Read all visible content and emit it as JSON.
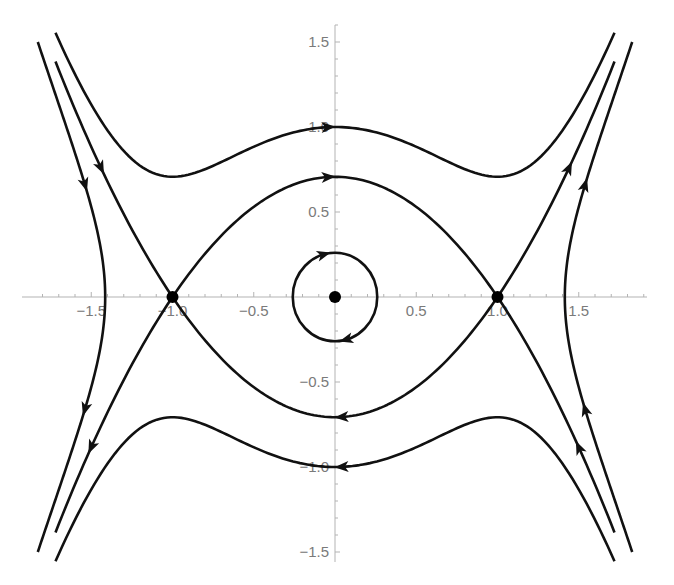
{
  "chart_data": {
    "type": "line",
    "subtype": "phase-portrait",
    "title": "",
    "xlabel": "",
    "ylabel": "",
    "xlim": [
      -1.8,
      1.92
    ],
    "ylim": [
      -1.55,
      1.6
    ],
    "grid": false,
    "legend": null,
    "x_ticks": [
      -1.5,
      -1.0,
      -0.5,
      0.5,
      1.0,
      1.5
    ],
    "x_tick_labels": [
      "-1.5",
      "-1.0",
      "-0.5",
      "0.5",
      "1.0",
      "1.5"
    ],
    "y_ticks": [
      1.5,
      1.0,
      0.5,
      -0.5,
      -1.0,
      -1.5
    ],
    "y_tick_labels": [
      "1.5",
      "1.0",
      "0.5",
      "-0.5",
      "-1.0",
      "-1.5"
    ],
    "equilibria": [
      {
        "x": -1.0,
        "y": 0,
        "kind": "saddle"
      },
      {
        "x": 0.0,
        "y": 0,
        "kind": "center"
      },
      {
        "x": 1.0,
        "y": 0,
        "kind": "saddle"
      }
    ],
    "system": "x' = y, y' = -x + x^3  (H = y^2/2 + x^2/2 - x^4/4)",
    "trajectories": [
      {
        "name": "H=0.5 upper",
        "formula": "y = sqrt(1 - x^2 + x^4/2)",
        "x_range": [
          -1.72,
          1.72
        ],
        "direction": "right",
        "arrow_x": [
          -0.04
        ]
      },
      {
        "name": "H=0.5 lower",
        "formula": "y = -sqrt(1 - x^2 + x^4/2)",
        "x_range": [
          -1.72,
          1.72
        ],
        "direction": "left",
        "arrow_x": [
          0.04
        ]
      },
      {
        "name": "separatrix upper inner",
        "formula": "y = (1 - x^2)/sqrt(2)",
        "x_range": [
          -1,
          1
        ],
        "direction": "right",
        "arrow_x": [
          -0.04
        ]
      },
      {
        "name": "separatrix lower inner",
        "formula": "y = -(1 - x^2)/sqrt(2)",
        "x_range": [
          -1,
          1
        ],
        "direction": "left",
        "arrow_x": [
          0.04
        ]
      },
      {
        "name": "separatrix upper-left",
        "formula": "y = (x^2 - 1)/sqrt(2)",
        "x_range": [
          -1.72,
          -1
        ],
        "direction": "right",
        "arrow_x": [
          -1.44
        ]
      },
      {
        "name": "separatrix lower-left",
        "formula": "y = -(x^2 - 1)/sqrt(2)",
        "x_range": [
          -1.72,
          -1
        ],
        "direction": "left",
        "arrow_x": [
          -1.5
        ]
      },
      {
        "name": "separatrix upper-right",
        "formula": "y = (x^2 - 1)/sqrt(2)",
        "x_range": [
          1,
          1.72
        ],
        "direction": "right",
        "arrow_x": [
          1.44
        ]
      },
      {
        "name": "separatrix lower-right",
        "formula": "y = -(x^2 - 1)/sqrt(2)",
        "x_range": [
          1,
          1.72
        ],
        "direction": "left",
        "arrow_x": [
          1.5
        ]
      },
      {
        "name": "H=0 left",
        "formula": "x^4/2 - x^2 = y^2, x <= -sqrt(2)",
        "y_range": [
          -1.5,
          1.5
        ],
        "direction": "down",
        "arrow_y": [
          0.66,
          -0.66
        ]
      },
      {
        "name": "H=0 right",
        "formula": "x^4/2 - x^2 = y^2, x >= sqrt(2)",
        "y_range": [
          -1.5,
          1.5
        ],
        "direction": "up",
        "arrow_y": [
          -0.66,
          0.66
        ]
      },
      {
        "name": "small orbit",
        "formula": "x^2 + y^2 = 0.26^2",
        "radius": 0.26,
        "direction": "clockwise",
        "arrow_angles_deg": [
          105,
          -75
        ]
      }
    ]
  },
  "colors": {
    "curve": "#111111",
    "axis": "#b3b3b3",
    "tick_label": "#7a7a7a",
    "background": "#ffffff"
  }
}
